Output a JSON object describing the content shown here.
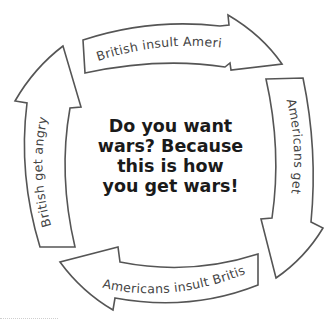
{
  "diagram": {
    "type": "cycle",
    "center_text": {
      "lines": [
        "Do you want",
        "wars? Because",
        "this is how",
        "you get wars!"
      ]
    },
    "steps": [
      {
        "label": "British insult Americans",
        "position": "top",
        "direction": "clockwise"
      },
      {
        "label": "Americans get angry",
        "position": "right",
        "direction": "clockwise"
      },
      {
        "label": "Americans insult British",
        "position": "bottom",
        "direction": "clockwise"
      },
      {
        "label": "British get angry",
        "position": "left",
        "direction": "clockwise"
      }
    ],
    "colors": {
      "stroke": "#555555",
      "fill": "#ffffff",
      "label": "#444444",
      "center_text": "#1a1a1a",
      "background": "#ffffff"
    }
  }
}
